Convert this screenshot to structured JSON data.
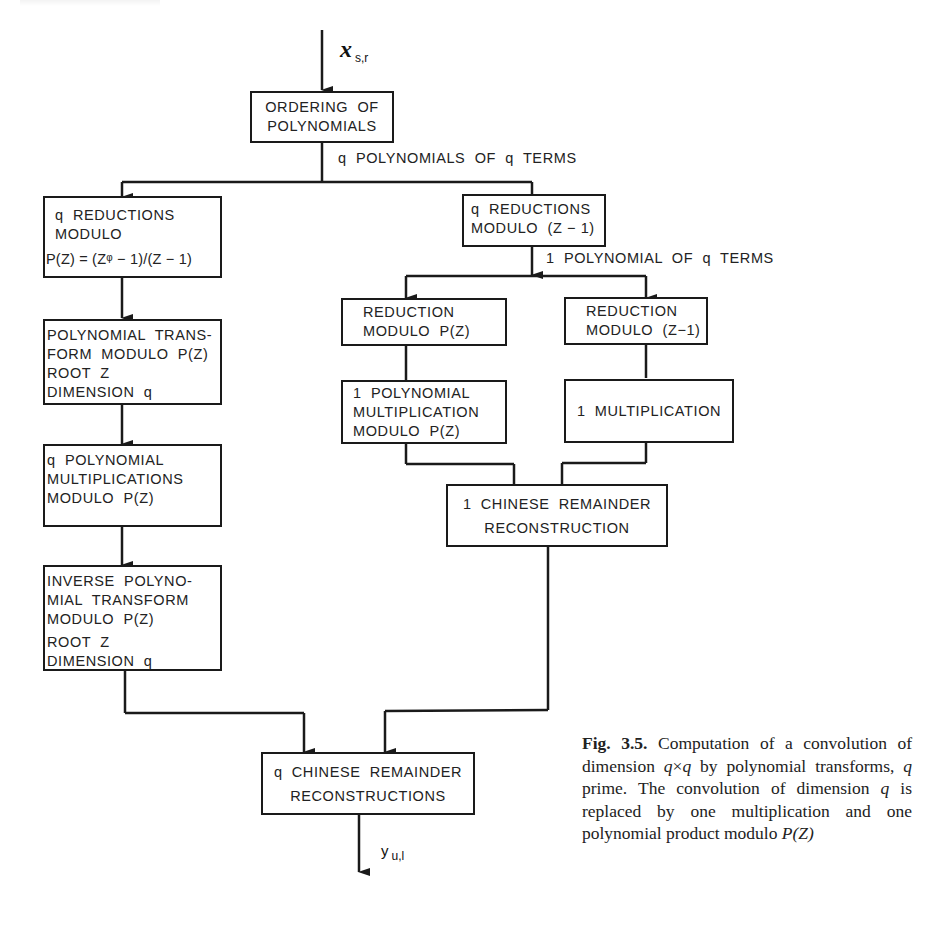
{
  "diagram": {
    "input_label": {
      "symbol": "x",
      "subscript": "s,r"
    },
    "output_label": {
      "symbol": "y",
      "subscript": "u,l"
    },
    "edge_labels": {
      "after_ordering": "q  POLYNOMIALS  OF  q  TERMS",
      "after_reduction_z1": "1  POLYNOMIAL  OF  q  TERMS"
    },
    "boxes": {
      "ordering": [
        "ORDERING  OF",
        "POLYNOMIALS"
      ],
      "reductions_pz": [
        "q  REDUCTIONS",
        "MODULO",
        "P(Z) = (Zᵠ − 1)/(Z − 1)"
      ],
      "reductions_z1": [
        "q  REDUCTIONS",
        "MODULO  (Z − 1)"
      ],
      "poly_transform": [
        "POLYNOMIAL  TRANS-",
        "FORM  MODULO  P(Z)",
        "ROOT  Z",
        "DIMENSION  q"
      ],
      "poly_mults": [
        "q  POLYNOMIAL",
        "MULTIPLICATIONS",
        "MODULO  P(Z)"
      ],
      "inverse_transform": [
        "INVERSE  POLYNO-",
        "MIAL  TRANSFORM",
        "MODULO  P(Z)",
        "ROOT  Z",
        "DIMENSION  q"
      ],
      "reduction_pz_single": [
        "REDUCTION",
        "MODULO  P(Z)"
      ],
      "reduction_z1_single": [
        "REDUCTION",
        "MODULO  (Z−1)"
      ],
      "one_poly_mult": [
        "1  POLYNOMIAL",
        "MULTIPLICATION",
        "MODULO  P(Z)"
      ],
      "one_mult": [
        "1  MULTIPLICATION"
      ],
      "one_crt": [
        "1  CHINESE  REMAINDER",
        "RECONSTRUCTION"
      ],
      "q_crt": [
        "q  CHINESE  REMAINDER",
        "RECONSTRUCTIONS"
      ]
    },
    "stroke_color": "#1a1a1a"
  },
  "caption": {
    "fig_number": "Fig. 3.5.",
    "text_1": " Computation of a convolution of dimension ",
    "q1": "q",
    "times": "×",
    "q2": "q",
    "text_2": " by polynomial transforms, ",
    "q3": "q",
    "text_3": " prime. The convolution of dimension ",
    "q4": "q",
    "text_4": " is replaced by one multiplication and one polynomial product modulo ",
    "pz": "P(Z)"
  }
}
